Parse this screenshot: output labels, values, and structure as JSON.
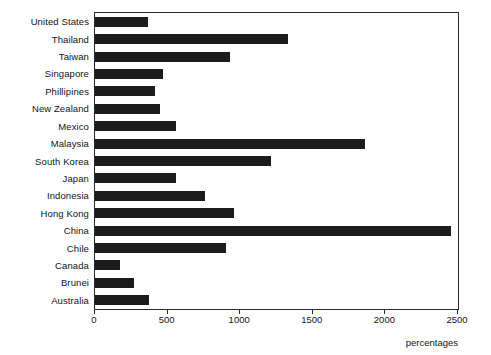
{
  "chart_data": {
    "type": "bar",
    "orientation": "horizontal",
    "title": "",
    "xlabel": "percentages",
    "ylabel": "",
    "xlim": [
      0,
      2500
    ],
    "xticks": [
      0,
      500,
      1000,
      1500,
      2000,
      2500
    ],
    "xtick_labels": [
      "0",
      "500",
      "1000",
      "1500",
      "2000",
      "2500"
    ],
    "grid": false,
    "legend": false,
    "bar_color": "#1c1c1c",
    "categories": [
      "United States",
      "Thailand",
      "Taiwan",
      "Singapore",
      "Phillipines",
      "New Zealand",
      "Mexico",
      "Malaysia",
      "South Korea",
      "Japan",
      "Indonesia",
      "Hong Kong",
      "China",
      "Chile",
      "Canada",
      "Brunei",
      "Australia"
    ],
    "values": [
      365,
      1330,
      930,
      465,
      410,
      445,
      555,
      1860,
      1215,
      555,
      755,
      960,
      2450,
      900,
      170,
      270,
      370
    ]
  }
}
